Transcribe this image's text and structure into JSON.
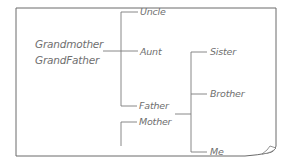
{
  "diagram": {
    "type": "family-tree",
    "colors": {
      "line": "#7a7a7a",
      "text": "#6f6f6f",
      "paper": "#ffffff"
    },
    "root": {
      "line1": "Grandmother",
      "line2": "GrandFather"
    },
    "generation2": [
      {
        "label": "Uncle"
      },
      {
        "label": "Aunt"
      },
      {
        "label": "Father"
      },
      {
        "label": "Mother"
      }
    ],
    "generation3": [
      {
        "label": "Sister"
      },
      {
        "label": "Brother"
      },
      {
        "label": "Me"
      }
    ],
    "edges": [
      {
        "from": "Grandmother/GrandFather",
        "to": "Uncle"
      },
      {
        "from": "Grandmother/GrandFather",
        "to": "Aunt"
      },
      {
        "from": "Grandmother/GrandFather",
        "to": "Father"
      },
      {
        "from": "Father/Mother",
        "to": "Sister"
      },
      {
        "from": "Father/Mother",
        "to": "Brother"
      },
      {
        "from": "Father/Mother",
        "to": "Me"
      }
    ]
  }
}
